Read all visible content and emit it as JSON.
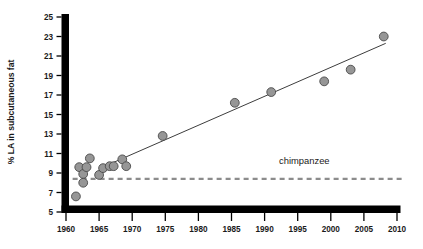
{
  "chart_data": {
    "type": "scatter",
    "title": "",
    "xlabel": "",
    "ylabel": "% LA in subcutaneous fat",
    "xlim": [
      1960,
      2011
    ],
    "ylim": [
      5,
      25
    ],
    "xticks": [
      1960,
      1965,
      1970,
      1975,
      1980,
      1985,
      1990,
      1995,
      2000,
      2005,
      2010
    ],
    "yticks": [
      5,
      7,
      9,
      11,
      13,
      15,
      17,
      19,
      21,
      23,
      25
    ],
    "grid": false,
    "legend": null,
    "series": [
      {
        "name": "% LA in subcutaneous fat",
        "type": "scatter",
        "marker": "filled-circle-gray",
        "color": "#969696",
        "points": [
          {
            "x": 1961.5,
            "y": 6.6
          },
          {
            "x": 1962.0,
            "y": 9.6
          },
          {
            "x": 1962.6,
            "y": 8.9
          },
          {
            "x": 1962.6,
            "y": 8.0
          },
          {
            "x": 1963.1,
            "y": 9.6
          },
          {
            "x": 1963.6,
            "y": 10.5
          },
          {
            "x": 1965.0,
            "y": 8.8
          },
          {
            "x": 1965.6,
            "y": 9.5
          },
          {
            "x": 1966.6,
            "y": 9.7
          },
          {
            "x": 1967.2,
            "y": 9.7
          },
          {
            "x": 1968.5,
            "y": 10.4
          },
          {
            "x": 1969.1,
            "y": 9.7
          },
          {
            "x": 1974.6,
            "y": 12.8
          },
          {
            "x": 1985.5,
            "y": 16.2
          },
          {
            "x": 1991.0,
            "y": 17.3
          },
          {
            "x": 1999.0,
            "y": 18.4
          },
          {
            "x": 2003.0,
            "y": 19.6
          },
          {
            "x": 2008.0,
            "y": 23.0
          }
        ]
      },
      {
        "name": "trend",
        "type": "line",
        "color": "#3d3d3d",
        "points": [
          {
            "x": 1965.2,
            "y": 9.5
          },
          {
            "x": 2008.3,
            "y": 22.3
          }
        ]
      },
      {
        "name": "chimpanzee",
        "type": "reference-line",
        "style": "dashed",
        "color": "#8c8c8c",
        "value": 8.4,
        "points": [
          {
            "x": 1961.0,
            "y": 8.4
          },
          {
            "x": 2010.8,
            "y": 8.4
          }
        ]
      }
    ],
    "annotations": [
      {
        "text": "chimpanzee",
        "x": 1996.0,
        "y": 9.9
      }
    ]
  }
}
